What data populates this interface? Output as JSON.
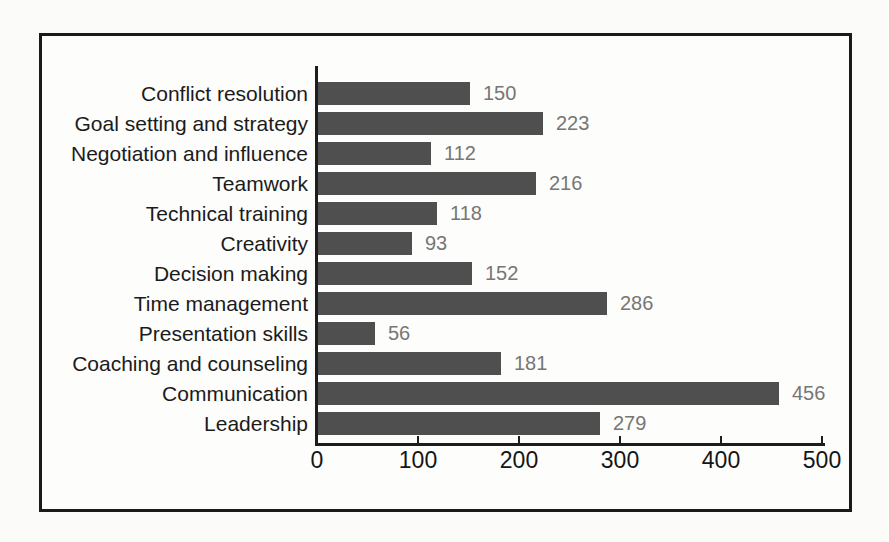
{
  "figure": {
    "title": ""
  },
  "colors": {
    "bar": "#4f4f4f",
    "value_label": "#767676",
    "axis": "#1d1d1d",
    "frame_border": "#1a1a1a",
    "category_label": "#1b1b1b",
    "tick_label": "#151515"
  },
  "chart_data": {
    "type": "bar",
    "orientation": "horizontal",
    "title": "",
    "xlabel": "",
    "ylabel": "",
    "grid": false,
    "legend": null,
    "xlim": [
      0,
      500
    ],
    "x_ticks": [
      0,
      100,
      200,
      300,
      400,
      500
    ],
    "categories": [
      "Conflict resolution",
      "Goal setting and strategy",
      "Negotiation and influence",
      "Teamwork",
      "Technical training",
      "Creativity",
      "Decision making",
      "Time management",
      "Presentation skills",
      "Coaching and counseling",
      "Communication",
      "Leadership"
    ],
    "values": [
      150,
      223,
      112,
      216,
      118,
      93,
      152,
      286,
      56,
      181,
      456,
      279
    ]
  }
}
